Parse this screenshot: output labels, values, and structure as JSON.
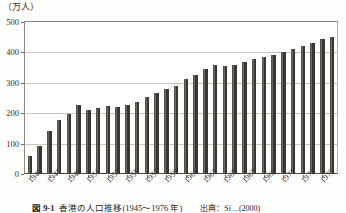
{
  "figure": {
    "y_axis_unit": "（万人）",
    "caption_number": "図 9-1",
    "caption_title": "香港の人口推移(1945～1976 年)",
    "caption_source": "出典：Si ...(2000)"
  },
  "chart_data": {
    "type": "bar",
    "title": "香港の人口推移(1945～1976 年)",
    "xlabel": "",
    "ylabel": "（万人）",
    "ylim": [
      0,
      500
    ],
    "yticks": [
      0,
      100,
      200,
      300,
      400,
      500
    ],
    "grid": true,
    "legend": "none",
    "bar_color": "#3b3630",
    "x_tick_labels": [
      "1945",
      "1947",
      "1949",
      "1951",
      "1953",
      "1955",
      "1957",
      "1959",
      "1961",
      "1963",
      "1965",
      "1967",
      "1969",
      "1971",
      "1973",
      "1975"
    ],
    "categories": [
      "1945",
      "1946",
      "1947",
      "1948",
      "1949",
      "1950",
      "1951",
      "1952",
      "1953",
      "1954",
      "1955",
      "1956",
      "1957",
      "1958",
      "1959",
      "1960",
      "1961",
      "1962",
      "1963",
      "1964",
      "1965",
      "1966",
      "1967",
      "1968",
      "1969",
      "1970",
      "1971",
      "1972",
      "1973",
      "1974",
      "1975",
      "1976"
    ],
    "values": [
      60,
      92,
      140,
      179,
      198,
      227,
      209,
      216,
      223,
      222,
      226,
      238,
      252,
      266,
      279,
      291,
      311,
      327,
      346,
      357,
      356,
      359,
      370,
      378,
      384,
      392,
      403,
      410,
      420,
      431,
      443,
      450
    ]
  }
}
